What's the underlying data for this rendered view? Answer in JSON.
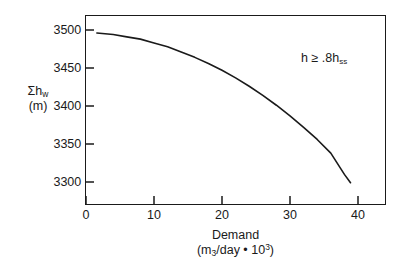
{
  "chart_data": {
    "type": "line",
    "title": "",
    "xlabel": "Demand",
    "xlabel_units": "(m3/day • 103)",
    "ylabel": "Σh",
    "ylabel_sub": "w",
    "ylabel_units": "(m)",
    "xlim": [
      0,
      43
    ],
    "ylim": [
      3260,
      3522
    ],
    "xticks": [
      0,
      10,
      20,
      30,
      40
    ],
    "xtick_labels": [
      "0",
      "10",
      "20",
      "30",
      "40"
    ],
    "yticks": [
      3300,
      3350,
      3400,
      3450,
      3500
    ],
    "ytick_labels": [
      "3300",
      "3350",
      "3400",
      "3450",
      "3500"
    ],
    "grid": false,
    "legend": "none",
    "annotations": [
      {
        "text_before": "h ≥ .8h",
        "text_sub": "ss",
        "x": 32,
        "y": 3470
      }
    ],
    "series": [
      {
        "name": "sum of well head losses vs demand",
        "color": "#1a1a1a",
        "x": [
          1.6,
          4,
          6,
          8,
          10,
          12,
          14,
          16,
          18,
          20,
          22,
          24,
          26,
          28,
          30,
          32,
          34,
          36,
          38,
          38.9
        ],
        "y": [
          3496,
          3494,
          3491,
          3488,
          3483,
          3478,
          3471,
          3464,
          3456,
          3447,
          3437,
          3426,
          3414,
          3401,
          3387,
          3372,
          3356,
          3338,
          3310,
          3299
        ]
      }
    ]
  },
  "axis": {
    "ylabel_line1": "Σh",
    "ylabel_line1_sub": "w",
    "ylabel_line2": "(m)",
    "xlabel_line1": "Demand",
    "xlabel_units_open": "(m",
    "xlabel_units_sub": "3",
    "xlabel_units_mid": "/day • 10",
    "xlabel_units_sup": "3",
    "xlabel_units_close": ")"
  },
  "annotation": {
    "text": "h ≥ .8h",
    "subscript": "ss"
  },
  "colors": {
    "line": "#1a1a1a",
    "frame": "#1a1a1a",
    "background": "#ffffff",
    "text": "#1a1a1a"
  }
}
